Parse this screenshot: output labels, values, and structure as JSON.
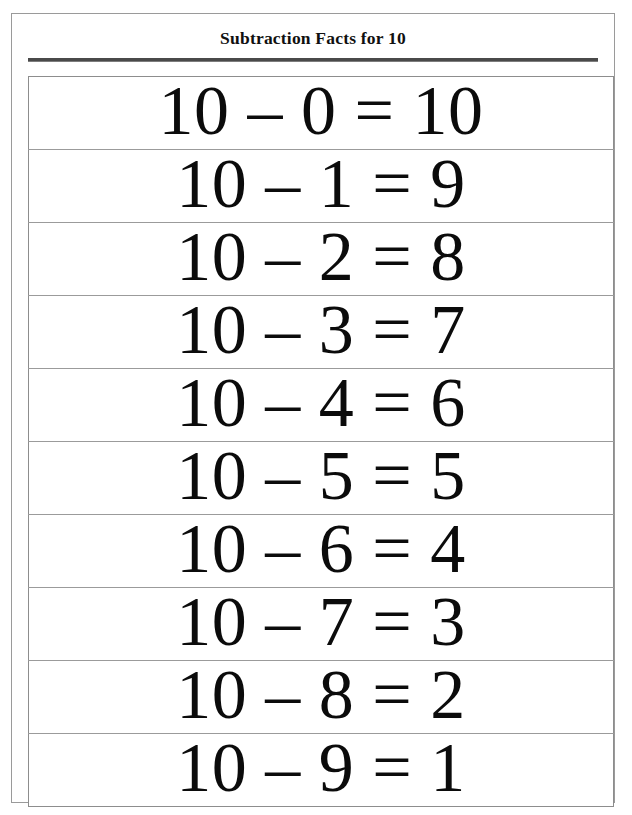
{
  "worksheet": {
    "title": "Subtraction Facts for 10",
    "colors": {
      "page_border": "#9a9a9a",
      "rule": "#4a4a4a",
      "table_border": "#8d8d8d",
      "row_divider": "#9b9b9b",
      "text": "#0b0b0b",
      "background": "#ffffff"
    },
    "minuend": "10",
    "operator": "–",
    "equals": "=",
    "facts": [
      {
        "minuend": "10",
        "subtrahend": "0",
        "difference": "10",
        "equation": "10 – 0 = 10"
      },
      {
        "minuend": "10",
        "subtrahend": "1",
        "difference": "9",
        "equation": "10 – 1 = 9"
      },
      {
        "minuend": "10",
        "subtrahend": "2",
        "difference": "8",
        "equation": "10 – 2 = 8"
      },
      {
        "minuend": "10",
        "subtrahend": "3",
        "difference": "7",
        "equation": "10 – 3 = 7"
      },
      {
        "minuend": "10",
        "subtrahend": "4",
        "difference": "6",
        "equation": "10 – 4 = 6"
      },
      {
        "minuend": "10",
        "subtrahend": "5",
        "difference": "5",
        "equation": "10 – 5 = 5"
      },
      {
        "minuend": "10",
        "subtrahend": "6",
        "difference": "4",
        "equation": "10 – 6 = 4"
      },
      {
        "minuend": "10",
        "subtrahend": "7",
        "difference": "3",
        "equation": "10 – 7 = 3"
      },
      {
        "minuend": "10",
        "subtrahend": "8",
        "difference": "2",
        "equation": "10 – 8 = 2"
      },
      {
        "minuend": "10",
        "subtrahend": "9",
        "difference": "1",
        "equation": "10 – 9 = 1"
      }
    ]
  }
}
